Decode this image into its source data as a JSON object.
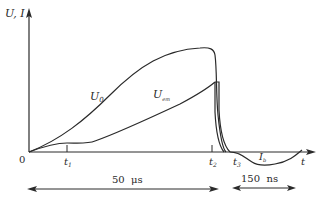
{
  "diagram": {
    "y_axis_label": "U, I",
    "x_axis_label": "t",
    "origin_label": "0",
    "time_markers": [
      {
        "name": "t",
        "sub": "1"
      },
      {
        "name": "t",
        "sub": "2"
      },
      {
        "name": "t",
        "sub": "3"
      }
    ],
    "curves": [
      {
        "name": "U",
        "sub": "0"
      },
      {
        "name": "U",
        "sub": "em"
      },
      {
        "name": "I",
        "sub": "b"
      }
    ],
    "durations": [
      {
        "label": "50  μs"
      },
      {
        "label": "150  ns"
      }
    ],
    "colors": {
      "line": "#2a2a2a",
      "background": "#ffffff"
    }
  }
}
